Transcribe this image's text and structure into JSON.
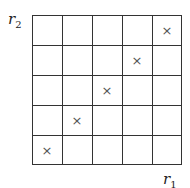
{
  "axes": {
    "y_label": "r",
    "y_sub": "2",
    "x_label": "r",
    "x_sub": "1"
  },
  "grid": {
    "rows": 5,
    "cols": 5
  },
  "marks": [
    {
      "row": 0,
      "col": 4,
      "symbol": "×"
    },
    {
      "row": 1,
      "col": 3,
      "symbol": "×"
    },
    {
      "row": 2,
      "col": 2,
      "symbol": "×"
    },
    {
      "row": 3,
      "col": 1,
      "symbol": "×"
    },
    {
      "row": 4,
      "col": 0,
      "symbol": "×"
    }
  ]
}
